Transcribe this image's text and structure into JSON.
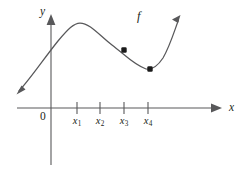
{
  "figure": {
    "background_color": "#ffffff",
    "stroke_color": "#58585a",
    "text_color": "#231f20",
    "dot_color": "#1a1a1a",
    "width": 245,
    "height": 177
  },
  "labels": {
    "y_axis": "y",
    "x_axis": "x",
    "origin": "0",
    "function": "f"
  },
  "chart_data": {
    "type": "line",
    "title": "",
    "xlabel": "x",
    "ylabel": "y",
    "grid": false,
    "legend": null,
    "annotations": [
      {
        "text": "f",
        "x": 140,
        "y": 18,
        "note": "curve label"
      },
      {
        "text": "0",
        "x": 44,
        "y": 118,
        "note": "origin label"
      }
    ],
    "axes": {
      "x_axis_y_px": 108,
      "y_axis_x_px": 51,
      "x_axis_from_px": 17,
      "x_axis_to_px": 222,
      "y_axis_from_px": 165,
      "y_axis_to_px": 14,
      "arrows": [
        "x-positive",
        "y-positive"
      ]
    },
    "ticks": [
      {
        "label": "x",
        "sub": "1",
        "x_px": 77
      },
      {
        "label": "x",
        "sub": "2",
        "x_px": 100
      },
      {
        "label": "x",
        "sub": "3",
        "x_px": 124
      },
      {
        "label": "x",
        "sub": "4",
        "x_px": 148
      }
    ],
    "curve": {
      "name": "f",
      "path": "M 17 93 C 30 79, 44 57, 58 41 C 68 29, 74 23, 80 23 C 90 23, 100 36, 112 45 C 124 54, 134 65, 146 69 C 152 70, 157 67, 163 58 C 170 46, 175 30, 180 17",
      "start_arrow": {
        "x": 17,
        "y": 93,
        "direction": "down-left"
      },
      "end_arrow": {
        "x": 180,
        "y": 17,
        "direction": "up-right"
      },
      "shape_description": "increasing then local max near x1, decreasing through inflection, local min between x3 and x4, then increasing"
    },
    "points": [
      {
        "x_px": 124,
        "y_px": 50,
        "note": "inflection point at x3"
      },
      {
        "x_px": 150,
        "y_px": 69,
        "note": "local minimum near x4"
      }
    ]
  }
}
